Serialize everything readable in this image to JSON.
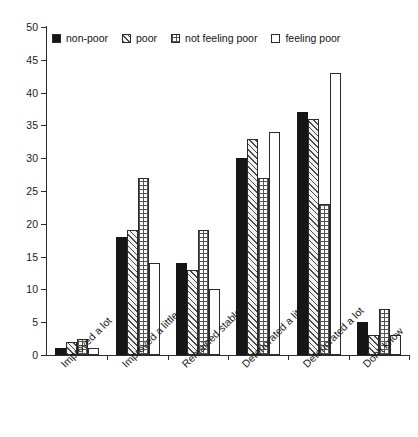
{
  "chart_data": {
    "type": "bar",
    "title": "",
    "subtitle": "",
    "xlabel": "",
    "ylabel": "",
    "ylim": [
      0,
      50
    ],
    "ytick_step": 5,
    "yticks": [
      0,
      5,
      10,
      15,
      20,
      25,
      30,
      35,
      40,
      45,
      50
    ],
    "grid": false,
    "legend_position": "top-left-inside",
    "categories": [
      "Improved a lot",
      "Improved a little",
      "Remained stable",
      "Deteriorated a little",
      "Deteriorated a lot",
      "Don't know"
    ],
    "series": [
      {
        "name": "non-poor",
        "pattern": "solid-black",
        "values": [
          1,
          18,
          14,
          30,
          37,
          5
        ]
      },
      {
        "name": "poor",
        "pattern": "diagonal-hatch",
        "values": [
          2,
          19,
          13,
          33,
          36,
          3
        ]
      },
      {
        "name": "not feeling poor",
        "pattern": "dotted-grid",
        "values": [
          2.5,
          27,
          19,
          27,
          23,
          7
        ]
      },
      {
        "name": "feeling poor",
        "pattern": "empty-white",
        "values": [
          1,
          14,
          10,
          34,
          43,
          3
        ]
      }
    ],
    "colors": {
      "non-poor": "#161616",
      "poor": "#f2f2f2",
      "not feeling poor": "#fbfbfb",
      "feeling poor": "#ffffff",
      "axis": "#2b2b2b",
      "text": "#1a1a1a"
    }
  },
  "legend": {
    "items": [
      {
        "label": "non-poor"
      },
      {
        "label": "poor"
      },
      {
        "label": "not feeling poor"
      },
      {
        "label": "feeling poor"
      }
    ]
  },
  "axis": {
    "y_tick_labels": [
      "0",
      "5",
      "10",
      "15",
      "20",
      "25",
      "30",
      "35",
      "40",
      "45",
      "50"
    ],
    "x_tick_labels": [
      "Improved a lot",
      "Improved a little",
      "Remained stable",
      "Deteriorated a little",
      "Deteriorated a lot",
      "Don't know"
    ]
  }
}
